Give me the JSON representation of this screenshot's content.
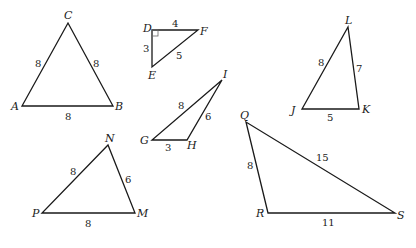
{
  "diagram": {
    "triangles": [
      {
        "name": "ABC",
        "vertices": [
          {
            "label": "A",
            "x": 22,
            "y": 106,
            "lx": 11,
            "ly": 110
          },
          {
            "label": "B",
            "x": 113,
            "y": 106,
            "lx": 115,
            "ly": 110
          },
          {
            "label": "C",
            "x": 68,
            "y": 23,
            "lx": 64,
            "ly": 19
          }
        ],
        "sides": [
          {
            "value": "8",
            "x": 35,
            "y": 67
          },
          {
            "value": "8",
            "x": 93,
            "y": 67
          },
          {
            "value": "8",
            "x": 65,
            "y": 120
          }
        ]
      },
      {
        "name": "DEF",
        "vertices": [
          {
            "label": "D",
            "x": 152,
            "y": 30,
            "lx": 143,
            "ly": 32
          },
          {
            "label": "F",
            "x": 198,
            "y": 30,
            "lx": 200,
            "ly": 35
          },
          {
            "label": "E",
            "x": 152,
            "y": 67,
            "lx": 148,
            "ly": 79
          }
        ],
        "sides": [
          {
            "value": "4",
            "x": 172,
            "y": 27
          },
          {
            "value": "3",
            "x": 143,
            "y": 52
          },
          {
            "value": "5",
            "x": 176,
            "y": 59
          }
        ],
        "right_angle_at": "D"
      },
      {
        "name": "GHI",
        "vertices": [
          {
            "label": "G",
            "x": 152,
            "y": 140,
            "lx": 140,
            "ly": 144
          },
          {
            "label": "H",
            "x": 187,
            "y": 140,
            "lx": 187,
            "ly": 149
          },
          {
            "label": "I",
            "x": 222,
            "y": 80,
            "lx": 223,
            "ly": 78
          }
        ],
        "sides": [
          {
            "value": "8",
            "x": 178,
            "y": 109
          },
          {
            "value": "6",
            "x": 205,
            "y": 120
          },
          {
            "value": "3",
            "x": 165,
            "y": 151
          }
        ]
      },
      {
        "name": "JKL",
        "vertices": [
          {
            "label": "J",
            "x": 302,
            "y": 109,
            "lx": 291,
            "ly": 114
          },
          {
            "label": "K",
            "x": 359,
            "y": 109,
            "lx": 362,
            "ly": 113
          },
          {
            "label": "L",
            "x": 348,
            "y": 27,
            "lx": 345,
            "ly": 24
          }
        ],
        "sides": [
          {
            "value": "8",
            "x": 318,
            "y": 66
          },
          {
            "value": "7",
            "x": 356,
            "y": 72
          },
          {
            "value": "5",
            "x": 327,
            "y": 121
          }
        ]
      },
      {
        "name": "NPM",
        "vertices": [
          {
            "label": "N",
            "x": 108,
            "y": 145,
            "lx": 105,
            "ly": 142
          },
          {
            "label": "P",
            "x": 42,
            "y": 213,
            "lx": 32,
            "ly": 217
          },
          {
            "label": "M",
            "x": 135,
            "y": 213,
            "lx": 137,
            "ly": 217
          }
        ],
        "sides": [
          {
            "value": "8",
            "x": 70,
            "y": 175
          },
          {
            "value": "6",
            "x": 125,
            "y": 183
          },
          {
            "value": "8",
            "x": 85,
            "y": 227
          }
        ]
      },
      {
        "name": "QRS",
        "vertices": [
          {
            "label": "Q",
            "x": 246,
            "y": 122,
            "lx": 240,
            "ly": 119
          },
          {
            "label": "R",
            "x": 268,
            "y": 213,
            "lx": 256,
            "ly": 217
          },
          {
            "label": "S",
            "x": 395,
            "y": 213,
            "lx": 397,
            "ly": 219
          }
        ],
        "sides": [
          {
            "value": "8",
            "x": 247,
            "y": 169
          },
          {
            "value": "15",
            "x": 316,
            "y": 161
          },
          {
            "value": "11",
            "x": 322,
            "y": 226
          }
        ]
      }
    ]
  }
}
